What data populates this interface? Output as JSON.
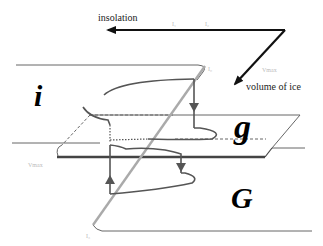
{
  "axes": {
    "insolation_label": "insolation",
    "volume_label": "volume of ice",
    "insolation_ticks": [
      "I₁",
      "I₂"
    ],
    "vmax_axis_label": "Vmax"
  },
  "states": {
    "interglacial": "i",
    "mild_glacial": "g",
    "full_glacial": "G"
  },
  "thresholds": {
    "upper": "I₀",
    "lower": "I₃",
    "vmax_left": "Vmax"
  },
  "colors": {
    "axis": "#111111",
    "curve": "#555555",
    "diagonal": "#aaaaaa",
    "plane_edge": "#666666",
    "faint_label": "#bbbbbb"
  }
}
